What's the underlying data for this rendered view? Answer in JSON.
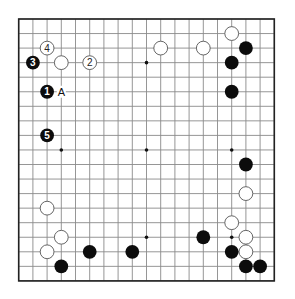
{
  "board": {
    "size": 19,
    "origin_x": 18.7,
    "origin_y": 19,
    "spacing_x": 14.2,
    "spacing_y": 14.55,
    "stone_radius": 6.9,
    "colors": {
      "black": "#0c0c0c",
      "white": "#ffffff",
      "grid": "#8a8a8a",
      "border": "#222222"
    }
  },
  "star_points": [
    [
      3,
      3
    ],
    [
      9,
      3
    ],
    [
      15,
      3
    ],
    [
      3,
      9
    ],
    [
      9,
      9
    ],
    [
      15,
      9
    ],
    [
      3,
      15
    ],
    [
      9,
      15
    ],
    [
      15,
      15
    ]
  ],
  "stones": [
    {
      "color": "white",
      "col": 2,
      "row": 2,
      "number": "4"
    },
    {
      "color": "black",
      "col": 1,
      "row": 3,
      "number": "3"
    },
    {
      "color": "white",
      "col": 3,
      "row": 3,
      "number": ""
    },
    {
      "color": "white",
      "col": 5,
      "row": 3,
      "number": "2"
    },
    {
      "color": "black",
      "col": 2,
      "row": 5,
      "number": "1"
    },
    {
      "color": "black",
      "col": 2,
      "row": 8,
      "number": "5"
    },
    {
      "color": "white",
      "col": 10,
      "row": 2,
      "number": ""
    },
    {
      "color": "white",
      "col": 13,
      "row": 2,
      "number": ""
    },
    {
      "color": "white",
      "col": 15,
      "row": 1,
      "number": ""
    },
    {
      "color": "black",
      "col": 16,
      "row": 2,
      "number": ""
    },
    {
      "color": "black",
      "col": 15,
      "row": 3,
      "number": ""
    },
    {
      "color": "black",
      "col": 15,
      "row": 5,
      "number": ""
    },
    {
      "color": "black",
      "col": 16,
      "row": 10,
      "number": ""
    },
    {
      "color": "white",
      "col": 16,
      "row": 12,
      "number": ""
    },
    {
      "color": "white",
      "col": 15,
      "row": 14,
      "number": ""
    },
    {
      "color": "white",
      "col": 16,
      "row": 15,
      "number": ""
    },
    {
      "color": "white",
      "col": 16,
      "row": 16,
      "number": ""
    },
    {
      "color": "black",
      "col": 15,
      "row": 16,
      "number": ""
    },
    {
      "color": "black",
      "col": 16,
      "row": 17,
      "number": ""
    },
    {
      "color": "black",
      "col": 17,
      "row": 17,
      "number": ""
    },
    {
      "color": "black",
      "col": 13,
      "row": 15,
      "number": ""
    },
    {
      "color": "black",
      "col": 8,
      "row": 16,
      "number": ""
    },
    {
      "color": "black",
      "col": 5,
      "row": 16,
      "number": ""
    },
    {
      "color": "white",
      "col": 2,
      "row": 13,
      "number": ""
    },
    {
      "color": "white",
      "col": 3,
      "row": 15,
      "number": ""
    },
    {
      "color": "white",
      "col": 2,
      "row": 16,
      "number": ""
    },
    {
      "color": "black",
      "col": 3,
      "row": 17,
      "number": ""
    }
  ],
  "labels": [
    {
      "text": "A",
      "col": 3,
      "row": 5
    }
  ]
}
